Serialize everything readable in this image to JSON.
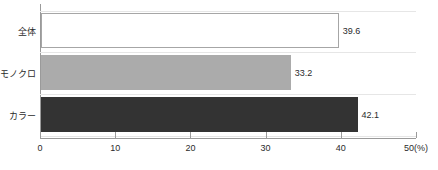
{
  "chart_data": {
    "type": "bar",
    "orientation": "horizontal",
    "title": "",
    "xlabel": "50(%)",
    "ylabel": "",
    "xlim": [
      0,
      50
    ],
    "xticks": [
      0,
      10,
      20,
      30,
      40,
      50
    ],
    "xtick_labels": [
      "0",
      "10",
      "20",
      "30",
      "40",
      "50(%)"
    ],
    "grid": false,
    "legend": null,
    "categories": [
      "全体",
      "モノクロ",
      "カラー"
    ],
    "values": [
      39.6,
      33.2,
      42.1
    ],
    "value_labels": [
      "39.6",
      "33.2",
      "42.1"
    ],
    "bar_colors": [
      "#ffffff",
      "#ababab",
      "#333333"
    ],
    "bar_border_colors": [
      "#a6a6a6",
      "#ababab",
      "#333333"
    ],
    "axis_color": "#9a9a9a",
    "text_color": "#2b2b2b"
  }
}
